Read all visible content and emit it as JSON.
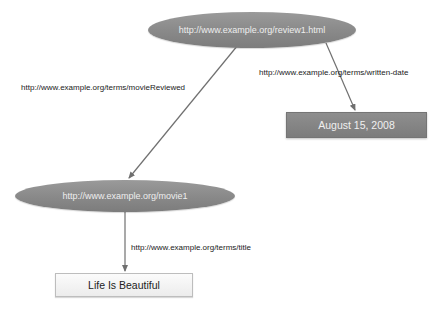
{
  "diagram": {
    "type": "rdf-graph",
    "nodes": [
      {
        "id": "review1",
        "label": "http://www.example.org/review1.html",
        "shape": "ellipse",
        "kind": "resource"
      },
      {
        "id": "movie1",
        "label": "http://www.example.org/movie1",
        "shape": "ellipse",
        "kind": "resource"
      },
      {
        "id": "date",
        "label": "August 15, 2008",
        "shape": "rectangle",
        "kind": "literal",
        "style": "dark"
      },
      {
        "id": "title",
        "label": "Life Is Beautiful",
        "shape": "rectangle",
        "kind": "literal",
        "style": "light"
      }
    ],
    "edges": [
      {
        "from": "review1",
        "to": "movie1",
        "label": "http://www.example.org/terms/movieReviewed"
      },
      {
        "from": "review1",
        "to": "date",
        "label": "http://www.example.org/terms/written-date"
      },
      {
        "from": "movie1",
        "to": "title",
        "label": "http://www.example.org/terms/title"
      }
    ]
  },
  "colors": {
    "ellipse_fill": "#8a8a8a",
    "ellipse_text": "#eeeeee",
    "dark_box_fill": "#858585",
    "light_box_fill": "#f4f4f4",
    "edge_stroke": "#707070",
    "label_text": "#222222"
  }
}
